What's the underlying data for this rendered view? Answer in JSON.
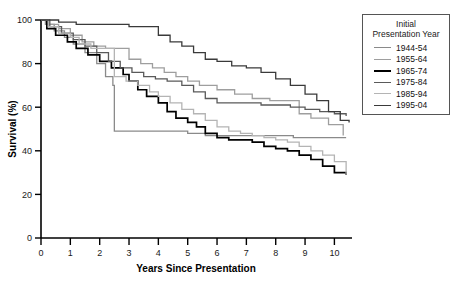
{
  "legend": {
    "title_line1": "Initial",
    "title_line2": "Presentation Year",
    "position": "top-right-outside",
    "entries": [
      {
        "label": "1944-54",
        "color": "#8a8a8a"
      },
      {
        "label": "1955-64",
        "color": "#9e9e9e"
      },
      {
        "label": "1965-74",
        "color": "#000000"
      },
      {
        "label": "1975-84",
        "color": "#5a5a5a"
      },
      {
        "label": "1985-94",
        "color": "#b4b4b4"
      },
      {
        "label": "1995-04",
        "color": "#3a3a3a"
      }
    ]
  },
  "axes": {
    "ylabel": "Survival (%)",
    "xlabel": "Years Since Presentation",
    "yticks": [
      "0",
      "20",
      "40",
      "60",
      "80",
      "100"
    ],
    "xticks": [
      "0",
      "1",
      "2",
      "3",
      "4",
      "5",
      "6",
      "7",
      "8",
      "9",
      "10"
    ]
  },
  "chart_data": {
    "type": "line",
    "title": "",
    "subtitle": "",
    "xlabel": "Years Since Presentation",
    "ylabel": "Survival (%)",
    "xlim": [
      0,
      10.6
    ],
    "ylim": [
      0,
      100
    ],
    "xticks": [
      0,
      1,
      2,
      3,
      4,
      5,
      6,
      7,
      8,
      9,
      10
    ],
    "yticks": [
      0,
      20,
      40,
      60,
      80,
      100
    ],
    "grid": false,
    "legend_position": "right-outside",
    "legend_title": "Initial Presentation Year",
    "step": "post",
    "note": "Kaplan-Meier survival curves; values are step-function survival proportions (%) read off the axes.",
    "series": [
      {
        "name": "1944-54",
        "color": "#8a8a8a",
        "x": [
          0,
          0.15,
          0.45,
          0.8,
          1.1,
          1.5,
          1.9,
          2.2,
          2.45,
          2.5,
          3.0,
          4.0,
          5.0,
          5.6,
          6.0,
          7.0,
          8.0,
          8.6,
          9.0,
          9.5,
          10.0,
          10.4
        ],
        "y": [
          100,
          98,
          95,
          92,
          89,
          85,
          80,
          74,
          70,
          49,
          49,
          49,
          48,
          47,
          47,
          47,
          47,
          46,
          46,
          46,
          46,
          46
        ]
      },
      {
        "name": "1955-64",
        "color": "#9e9e9e",
        "x": [
          0,
          0.2,
          0.6,
          1.0,
          1.4,
          1.8,
          2.2,
          2.6,
          3.0,
          3.4,
          3.8,
          4.2,
          4.6,
          5.0,
          5.4,
          6.0,
          6.6,
          7.2,
          7.8,
          8.4,
          8.8,
          9.2,
          9.8,
          10.3
        ],
        "y": [
          100,
          98,
          96,
          93,
          90,
          88,
          87,
          87,
          82,
          80,
          78,
          76,
          74,
          72,
          70,
          68,
          66,
          64,
          63,
          63,
          57,
          55,
          52,
          47
        ]
      },
      {
        "name": "1965-74",
        "color": "#000000",
        "x": [
          0,
          0.2,
          0.5,
          0.9,
          1.2,
          1.6,
          2.0,
          2.4,
          2.8,
          3.0,
          3.3,
          3.6,
          4.0,
          4.3,
          4.6,
          5.0,
          5.3,
          5.6,
          6.0,
          6.4,
          6.8,
          7.2,
          7.6,
          8.0,
          8.4,
          8.8,
          9.2,
          9.6,
          10.0,
          10.4
        ],
        "y": [
          100,
          96,
          93,
          90,
          87,
          84,
          81,
          78,
          75,
          72,
          68,
          65,
          62,
          58,
          55,
          53,
          51,
          48,
          46,
          45,
          45,
          44,
          42,
          41,
          40,
          38,
          36,
          33,
          30,
          29
        ]
      },
      {
        "name": "1975-84",
        "color": "#5a5a5a",
        "x": [
          0,
          0.3,
          0.7,
          1.1,
          1.5,
          1.9,
          2.3,
          2.7,
          3.1,
          3.5,
          3.9,
          4.3,
          4.8,
          5.2,
          5.6,
          6.0,
          6.5,
          7.0,
          7.5,
          8.0,
          8.5,
          9.0,
          9.5,
          10.0,
          10.4
        ],
        "y": [
          100,
          97,
          94,
          91,
          88,
          85,
          81,
          78,
          76,
          74,
          73,
          72,
          70,
          67,
          64,
          62,
          62,
          62,
          61,
          61,
          60,
          59,
          58,
          57,
          56
        ]
      },
      {
        "name": "1985-94",
        "color": "#b4b4b4",
        "x": [
          0,
          0.25,
          0.6,
          1.0,
          1.3,
          1.7,
          2.0,
          2.3,
          2.5,
          2.9,
          3.3,
          3.7,
          4.0,
          4.4,
          4.8,
          5.2,
          5.6,
          6.0,
          6.4,
          6.8,
          7.2,
          7.6,
          8.0,
          8.4,
          8.8,
          9.2,
          9.6,
          10.0,
          10.4
        ],
        "y": [
          100,
          97,
          94,
          92,
          89,
          87,
          87,
          87,
          74,
          72,
          70,
          67,
          65,
          62,
          59,
          57,
          54,
          51,
          49,
          48,
          47,
          46,
          45,
          44,
          42,
          40,
          38,
          35,
          29
        ]
      },
      {
        "name": "1995-04",
        "color": "#3a3a3a",
        "x": [
          0,
          0.6,
          1.2,
          1.8,
          2.4,
          3.0,
          3.6,
          4.0,
          4.4,
          4.8,
          5.2,
          5.6,
          6.0,
          6.5,
          7.0,
          7.5,
          8.0,
          8.5,
          9.0,
          9.4,
          9.8,
          10.2,
          10.5
        ],
        "y": [
          100,
          99,
          98,
          98,
          98,
          97,
          97,
          93,
          90,
          88,
          85,
          82,
          81,
          79,
          78,
          76,
          73,
          70,
          66,
          63,
          58,
          54,
          53
        ]
      }
    ]
  }
}
